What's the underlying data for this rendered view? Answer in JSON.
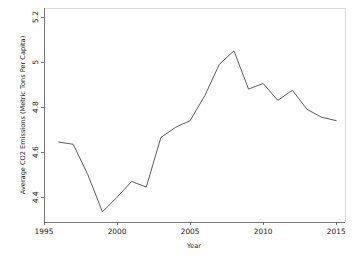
{
  "chart_data": {
    "type": "line",
    "title": "",
    "xlabel": "Year",
    "ylabel": "Average CO2 Emissions (Metric Tons Per Capita)",
    "xlim": [
      1995,
      2015.6
    ],
    "ylim": [
      4.29,
      5.24
    ],
    "xticks": [
      1995,
      2000,
      2005,
      2010,
      2015
    ],
    "xtick_labels": [
      "1995",
      "2000",
      "2005",
      "2010",
      "2015"
    ],
    "yticks": [
      4.4,
      4.6,
      4.8,
      5.0,
      5.2
    ],
    "ytick_labels": [
      "4.4",
      "4.6",
      "4.8",
      "5",
      "5.2"
    ],
    "grid": false,
    "legend": "none",
    "line_color": "#4a4a4a",
    "x": [
      1996,
      1997,
      1998,
      1999,
      2000,
      2001,
      2002,
      2003,
      2004,
      2005,
      2006,
      2007,
      2008,
      2009,
      2010,
      2011,
      2012,
      2013,
      2014,
      2015
    ],
    "values": [
      4.645,
      4.635,
      4.5,
      4.335,
      4.4,
      4.47,
      4.445,
      4.665,
      4.71,
      4.74,
      4.85,
      4.99,
      5.05,
      4.88,
      4.905,
      4.83,
      4.875,
      4.79,
      4.755,
      4.74
    ],
    "series": [
      {
        "name": "Average CO2 Emissions",
        "values": [
          4.645,
          4.635,
          4.5,
          4.335,
          4.4,
          4.47,
          4.445,
          4.665,
          4.71,
          4.74,
          4.85,
          4.99,
          5.05,
          4.88,
          4.905,
          4.83,
          4.875,
          4.79,
          4.755,
          4.74
        ]
      }
    ]
  },
  "figure": {
    "background_color": "#ffffff",
    "axis_color": "#555555",
    "text_color": "#1a1a1a"
  }
}
